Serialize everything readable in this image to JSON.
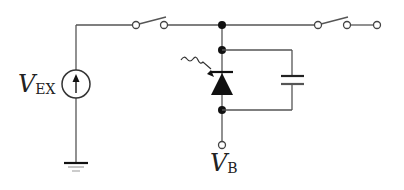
{
  "diagram": {
    "type": "circuit-schematic",
    "labels": {
      "source": {
        "main": "V",
        "sub": "EX"
      },
      "output": {
        "main": "V",
        "sub": "B"
      }
    },
    "components": [
      {
        "id": "voltage-source",
        "kind": "voltage source (arrow up)"
      },
      {
        "id": "ground",
        "kind": "ground"
      },
      {
        "id": "switch-left",
        "kind": "SPST switch"
      },
      {
        "id": "switch-right",
        "kind": "SPST switch"
      },
      {
        "id": "photodiode",
        "kind": "photodiode with incident light"
      },
      {
        "id": "capacitor",
        "kind": "capacitor, parallel to photodiode"
      },
      {
        "id": "vb-terminal",
        "kind": "output terminal"
      },
      {
        "id": "right-terminal",
        "kind": "output terminal"
      }
    ],
    "colors": {
      "wire": "#555555",
      "component": "#111111",
      "background": "#ffffff"
    }
  }
}
